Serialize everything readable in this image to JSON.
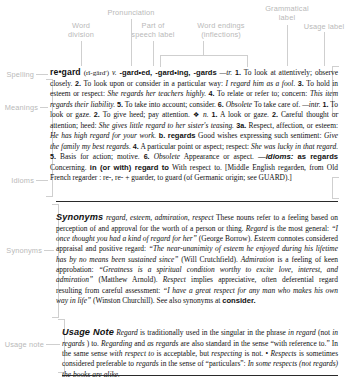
{
  "diagram": {
    "label_color": "#b9b9b9",
    "line_color": "#cfcfcf",
    "text_color": "#111111"
  },
  "callouts": {
    "word_division": "Word\ndivision",
    "pronunciation": "Pronunciation",
    "part_of_speech": "Part of\nspeech label",
    "word_endings": "Word endings\n(inflections)",
    "grammatical_label": "Grammatical\nlabel",
    "usage_label": "Usage label",
    "spelling": "Spelling",
    "meanings": "Meanings",
    "idioms": "Idioms",
    "synonyms": "Synonyms",
    "usage_note": "Usage note"
  },
  "entry": {
    "headword": "re•gard",
    "pronunciation": "(rĭ-gärd′)",
    "part_of_speech": "v.",
    "inflections": "-gard•ed, -gard•ing, -gards",
    "transitive_label": "—tr.",
    "intransitive_label": "—intr.",
    "noun_label": "n.",
    "noun_bullet": "❖",
    "senses_tr": [
      {
        "num": "1.",
        "text": "To look at attentively; observe closely."
      },
      {
        "num": "2.",
        "text": "To look upon or consider in a particular way:",
        "example": "I regard him as a fool."
      },
      {
        "num": "3.",
        "text": "To hold in esteem or respect:",
        "example": "She regards her teachers highly."
      },
      {
        "num": "4.",
        "text": "To relate or refer to; concern:",
        "example": "This item regards their liability."
      },
      {
        "num": "5.",
        "text": "To take into account; consider."
      },
      {
        "num": "6.",
        "label": "Obsolete",
        "text": "To take care of."
      }
    ],
    "senses_intr": [
      {
        "num": "1.",
        "text": "To look or gaze."
      },
      {
        "num": "2.",
        "text": "To give heed; pay attention."
      }
    ],
    "senses_n": [
      {
        "num": "1.",
        "text": "A look or gaze."
      },
      {
        "num": "2.",
        "text": "Careful thought or attention; heed:",
        "example": "She gives little regard to her sister's teasing."
      },
      {
        "num": "3a.",
        "text": "Respect, affection, or esteem:",
        "example": "He has high regard for your work."
      },
      {
        "num": "b.",
        "bold_word": "regards",
        "text": "Good wishes expressing such sentiment:",
        "example": "Give the family my best regards."
      },
      {
        "num": "4.",
        "text": "A particular point or aspect; respect:",
        "example": "She was lucky in that regard."
      },
      {
        "num": "5.",
        "text": "Basis for action; motive."
      },
      {
        "num": "6.",
        "label": "Obsolete",
        "text": "Appearance or aspect."
      }
    ],
    "idioms_head": "—idioms:",
    "idioms": [
      {
        "phrase": "as regards",
        "def": "Concerning."
      },
      {
        "phrase": "in (or with) regard to",
        "def": "With respect to."
      }
    ],
    "etymology": "[Middle English regarden, from Old French regarder : re-, re- + guarder, to guard (of Germanic origin; see GUARD).]",
    "etym_smallcap": "GUARD"
  },
  "synonyms_section": {
    "head": "Synonyms",
    "list": "regard, esteem, admiration, respect",
    "body_1": "These nouns refer to a feeling based on perception of and approval for the worth of a person or thing.",
    "w1": "Regard",
    "t1": "is the most general:",
    "q1": "“I once thought you had a kind of regard for her”",
    "a1": "(George Borrow).",
    "w2": "Esteem",
    "t2": "connotes considered appraisal and positive regard:",
    "q2": "“The near-unanimity of esteem he enjoyed during his lifetime has by no means been sustained since”",
    "a2": "(Will Crutchfield).",
    "w3": "Admiration",
    "t3": "is a feeling of keen approbation:",
    "q3": "“Greatness is a spiritual condition worthy to excite love, interest, and admiration”",
    "a3": "(Matthew Arnold).",
    "w4": "Respect",
    "t4": "implies appreciative, often deferential regard resulting from careful assessment:",
    "q4": "“I have a great respect for any man who makes his own way in life”",
    "a4": "(Winston Churchill).",
    "see_also": "See also synonyms at",
    "see_also_word": "consider."
  },
  "usage_section": {
    "head": "Usage Note",
    "w1": "Regard",
    "t1": "is traditionally used in the singular in the phrase",
    "p1": "in regard",
    "t2": "(not",
    "p2": "in regards",
    "t3": ") to.",
    "p3": "Regarding",
    "t4": "and",
    "p4": "as regards",
    "t5": "are also standard in the sense “with reference to.” In the same sense",
    "p5": "with respect to",
    "t6": "is acceptable, but",
    "p6": "respecting",
    "t7": "is not. •",
    "p7": "Respects",
    "t8": "is sometimes considered preferable to",
    "p8": "regards",
    "t9": "in the sense of “particulars”:",
    "q1": "In some respects (not regards) the books are alike."
  }
}
